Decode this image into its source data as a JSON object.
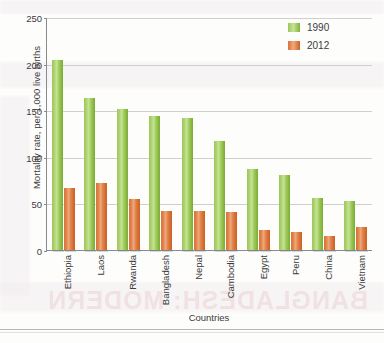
{
  "chart_data": {
    "type": "bar",
    "title": "",
    "xlabel": "Countries",
    "ylabel": "Mortality rate, per 1,000 live births",
    "ylim": [
      0,
      250
    ],
    "yticks": [
      0,
      50,
      100,
      150,
      200,
      250
    ],
    "grid": true,
    "legend_position": "top-right",
    "categories": [
      "Ethiopia",
      "Laos",
      "Rwanda",
      "Bangladesh",
      "Nepal",
      "Cambodia",
      "Egypt",
      "Peru",
      "China",
      "Vietnam"
    ],
    "series": [
      {
        "name": "1990",
        "color": "#8CC63F",
        "values": [
          204,
          163,
          151,
          144,
          142,
          117,
          87,
          80,
          56,
          53
        ]
      },
      {
        "name": "2012",
        "color": "#E07B3C",
        "values": [
          67,
          72,
          55,
          42,
          42,
          41,
          22,
          19,
          15,
          25
        ]
      }
    ]
  },
  "bleed_text": {
    "line1": "BANGLADESH: MODERN",
    "line2": "reverse page text"
  }
}
